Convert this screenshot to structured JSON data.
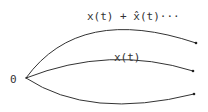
{
  "diagram": {
    "origin_label": "0",
    "curves": [
      {
        "name": "upper",
        "label": "x(t) + x̂(t)···"
      },
      {
        "name": "middle",
        "label": "x(t)"
      },
      {
        "name": "lower",
        "label": ""
      }
    ],
    "colors": {
      "stroke": "#333333",
      "background": "#ffffff"
    }
  }
}
